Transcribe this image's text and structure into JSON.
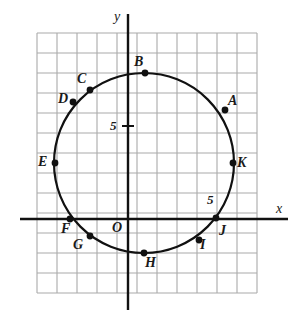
{
  "figure": {
    "type": "coordinate-plane-circle-diagram",
    "background": "#ffffff",
    "grid": {
      "visible": true,
      "color": "#a9a9a9",
      "spacing_px": 20,
      "left_px": 37,
      "top_px": 33,
      "cols": 11,
      "rows": 13
    },
    "axes": {
      "color": "#111111",
      "x_axis_y_px": 219,
      "y_axis_x_px": 128,
      "x_label": "x",
      "y_label": "y",
      "origin_label": "O",
      "x_tick_label": "5",
      "y_tick_label": "5"
    },
    "circle": {
      "color": "#111111",
      "center_x_px": 144,
      "center_y_px": 163,
      "radius_px": 90,
      "stroke_width_px": 2.2
    },
    "points": [
      {
        "id": "A",
        "label": "A",
        "cx": 225,
        "cy": 110,
        "lx": 228,
        "ly": 94
      },
      {
        "id": "B",
        "label": "B",
        "cx": 145,
        "cy": 73,
        "lx": 134,
        "ly": 55
      },
      {
        "id": "C",
        "label": "C",
        "cx": 90,
        "cy": 90,
        "lx": 77,
        "ly": 72
      },
      {
        "id": "D",
        "label": "D",
        "cx": 73,
        "cy": 102,
        "lx": 58,
        "ly": 92
      },
      {
        "id": "E",
        "label": "E",
        "cx": 55,
        "cy": 163,
        "lx": 38,
        "ly": 155
      },
      {
        "id": "F",
        "label": "F",
        "cx": 70,
        "cy": 219,
        "lx": 61,
        "ly": 222
      },
      {
        "id": "G",
        "label": "G",
        "cx": 90,
        "cy": 236,
        "lx": 73,
        "ly": 238
      },
      {
        "id": "H",
        "label": "H",
        "cx": 144,
        "cy": 253,
        "lx": 145,
        "ly": 256
      },
      {
        "id": "I",
        "label": "I",
        "cx": 199,
        "cy": 240,
        "lx": 200,
        "ly": 238
      },
      {
        "id": "J",
        "label": "J",
        "cx": 216,
        "cy": 218,
        "lx": 219,
        "ly": 224
      },
      {
        "id": "K",
        "label": "K",
        "cx": 233,
        "cy": 163,
        "lx": 237,
        "ly": 156
      }
    ]
  },
  "chart_data": {
    "type": "scatter",
    "title": "",
    "xlabel": "x",
    "ylabel": "y",
    "grid": true,
    "legend": null,
    "annotations": [
      "5",
      "5",
      "O"
    ],
    "shape": "circle centered at origin-offset with 11 marked points on circumference",
    "categories": [
      "A",
      "B",
      "C",
      "D",
      "E",
      "F",
      "G",
      "H",
      "I",
      "J",
      "K"
    ],
    "tick_labels": {
      "x": [
        "5"
      ],
      "y": [
        "5"
      ]
    }
  }
}
